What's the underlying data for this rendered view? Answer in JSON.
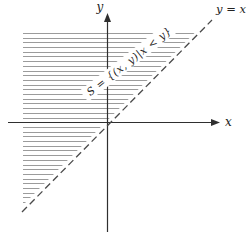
{
  "figure": {
    "y_axis_label": "y",
    "x_axis_label": "x",
    "line_label": "y = x",
    "region_label": "S = {(x, y)|x < y}",
    "colors": {
      "background": "#ffffff",
      "axis": "#2f2f2f",
      "dashed_line": "#4a4a4a",
      "hatch": "#9b9b9b",
      "text": "#222222"
    },
    "description": {
      "type": "coordinate-plane-diagram",
      "dashed_line_equation": "y = x",
      "shaded_region": "half-plane above the line y = x, hatched with horizontal lines"
    }
  }
}
